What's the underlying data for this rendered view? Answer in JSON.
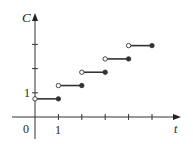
{
  "chart_data": {
    "type": "line",
    "subtype": "step",
    "title": "",
    "xlabel": "t",
    "ylabel": "C",
    "origin_label": "0",
    "x_tick_labels": [
      "1"
    ],
    "y_tick_labels": [
      "1"
    ],
    "x_ticks": [
      1,
      2,
      3,
      4,
      5
    ],
    "y_ticks": [
      1,
      2,
      3
    ],
    "xlim": [
      -1.4,
      6.9
    ],
    "ylim": [
      -0.9,
      4.3
    ],
    "grid": false,
    "legend": null,
    "segments": [
      {
        "x_start": 0,
        "x_end": 1,
        "y": 0.75,
        "start": "open",
        "end": "closed"
      },
      {
        "x_start": 1,
        "x_end": 2,
        "y": 1.3,
        "start": "open",
        "end": "closed"
      },
      {
        "x_start": 2,
        "x_end": 3,
        "y": 1.85,
        "start": "open",
        "end": "closed"
      },
      {
        "x_start": 3,
        "x_end": 4,
        "y": 2.4,
        "start": "open",
        "end": "closed"
      },
      {
        "x_start": 4,
        "x_end": 5,
        "y": 2.95,
        "start": "open",
        "end": "closed"
      }
    ],
    "colors": {
      "axis": "#333333",
      "line": "#333333",
      "text": "#222222"
    }
  },
  "labels": {
    "y_axis": "C",
    "x_axis": "t",
    "origin": "0",
    "x_tick_1": "1",
    "y_tick_1": "1"
  }
}
